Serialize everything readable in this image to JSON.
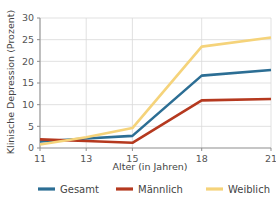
{
  "chart_data": {
    "type": "line",
    "title": "",
    "xlabel": "Alter (in Jahren)",
    "ylabel": "Klinische Depression (Prozent)",
    "x": [
      11,
      13,
      15,
      18,
      21
    ],
    "xtick_labels": [
      "11",
      "13",
      "15",
      "18",
      "21"
    ],
    "ytick_labels": [
      "0",
      "5",
      "10",
      "15",
      "20",
      "25",
      "30"
    ],
    "yticks": [
      0,
      5,
      10,
      15,
      20,
      25,
      30
    ],
    "xlim": [
      11,
      21
    ],
    "ylim": [
      0,
      30
    ],
    "grid": "horizontal-and-vertical",
    "legend_position": "bottom-center",
    "series": [
      {
        "name": "Gesamt",
        "color": "#2c6e94",
        "values": [
          1.5,
          2.2,
          2.8,
          16.7,
          18.0
        ]
      },
      {
        "name": "Männlich",
        "color": "#b5391f",
        "values": [
          2.0,
          1.6,
          1.2,
          11.0,
          11.3
        ]
      },
      {
        "name": "Weiblich",
        "color": "#f5d37a",
        "values": [
          0.8,
          2.5,
          4.6,
          23.4,
          25.5
        ]
      }
    ]
  },
  "legend": {
    "items": [
      {
        "label": "Gesamt",
        "color": "#2c6e94"
      },
      {
        "label": "Männlich",
        "color": "#b5391f"
      },
      {
        "label": "Weiblich",
        "color": "#f5d37a"
      }
    ]
  },
  "colors": {
    "gesamt": "#2c6e94",
    "maennlich": "#b5391f",
    "weiblich": "#f5d37a",
    "grid": "#d9d9d9",
    "axis": "#8d8d8d",
    "text": "#555555",
    "background": "#ffffff"
  }
}
